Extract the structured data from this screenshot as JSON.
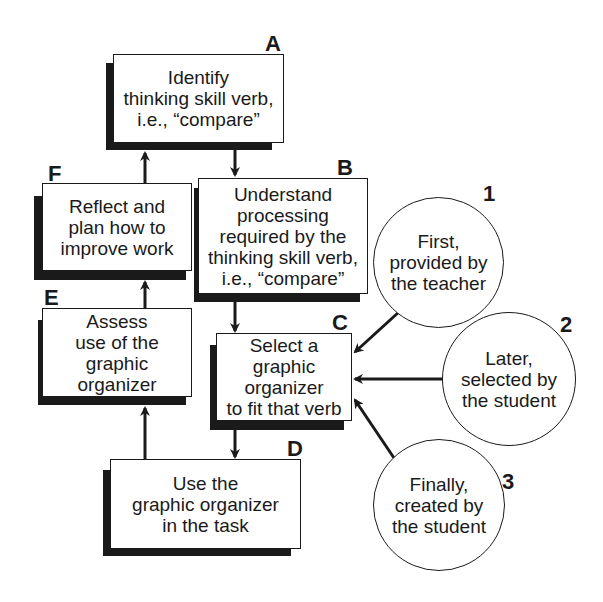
{
  "diagram": {
    "steps": [
      {
        "id": "A",
        "label": "A",
        "text": "Identify\nthinking skill verb,\ni.e., “compare”"
      },
      {
        "id": "B",
        "label": "B",
        "text": "Understand\nprocessing\nrequired by the\nthinking skill verb,\ni.e., “compare”"
      },
      {
        "id": "C",
        "label": "C",
        "text": "Select a\ngraphic\norganizer\nto fit that verb"
      },
      {
        "id": "D",
        "label": "D",
        "text": "Use the\ngraphic organizer\nin the task"
      },
      {
        "id": "E",
        "label": "E",
        "text": "Assess\nuse of the\ngraphic\norganizer"
      },
      {
        "id": "F",
        "label": "F",
        "text": "Reflect and\nplan how to\nimprove work"
      }
    ],
    "sources": [
      {
        "id": "1",
        "label": "1",
        "text": "First,\nprovided by\nthe teacher"
      },
      {
        "id": "2",
        "label": "2",
        "text": "Later,\nselected by\nthe student"
      },
      {
        "id": "3",
        "label": "3",
        "text": "Finally,\ncreated by\nthe student"
      }
    ],
    "flow": [
      {
        "from": "A",
        "to": "B"
      },
      {
        "from": "B",
        "to": "C"
      },
      {
        "from": "C",
        "to": "D"
      },
      {
        "from": "D",
        "to": "E"
      },
      {
        "from": "E",
        "to": "F"
      },
      {
        "from": "F",
        "to": "A"
      },
      {
        "from": "1",
        "to": "C"
      },
      {
        "from": "2",
        "to": "C"
      },
      {
        "from": "3",
        "to": "C"
      }
    ],
    "colors": {
      "ink": "#1a1a1a",
      "background": "#ffffff"
    }
  }
}
